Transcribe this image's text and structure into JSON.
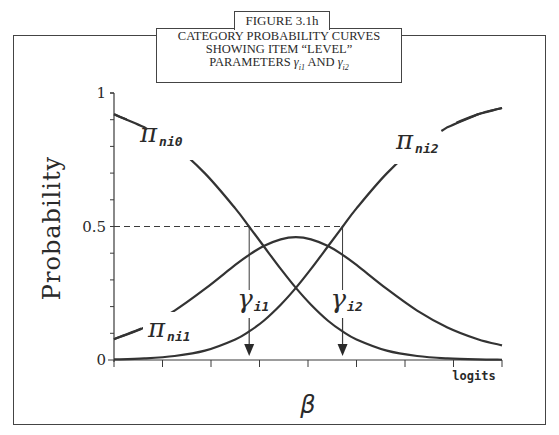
{
  "figure": {
    "tab_label": "FIGURE 3.1h",
    "title_lines": [
      "CATEGORY PROBABILITY CURVES",
      "SHOWING ITEM “LEVEL”",
      "PARAMETERS γi1 AND γi2"
    ]
  },
  "chart_data": {
    "type": "line",
    "title": "CATEGORY PROBABILITY CURVES SHOWING ITEM “LEVEL” PARAMETERS γi1 AND γi2",
    "xlabel": "β",
    "x_unit_label": "logits",
    "ylabel": "Probability",
    "yticks": [
      "0",
      "0.5",
      "1"
    ],
    "ylim": [
      0,
      1
    ],
    "xlim": [
      -3.0,
      3.4
    ],
    "x_tick_count": 9,
    "grid": false,
    "reference_line_y": 0.5,
    "thresholds": [
      {
        "name": "γi1",
        "symbol": "γ",
        "sub": "i1",
        "x": -0.77
      },
      {
        "name": "γi2",
        "symbol": "γ",
        "sub": "i2",
        "x": 0.77
      }
    ],
    "x": [
      -3.0,
      -2.5,
      -2.0,
      -1.5,
      -1.0,
      -0.77,
      -0.53,
      -0.25,
      0.0,
      0.25,
      0.53,
      0.77,
      1.0,
      1.5,
      2.0,
      2.5,
      3.0,
      3.4
    ],
    "series": [
      {
        "name": "πni0",
        "label_symbol": "π",
        "label_sub": "ni0",
        "values": [
          0.92,
          0.872,
          0.801,
          0.699,
          0.568,
          0.499,
          0.426,
          0.341,
          0.27,
          0.207,
          0.147,
          0.107,
          0.077,
          0.035,
          0.015,
          0.006,
          0.002,
          0.001
        ]
      },
      {
        "name": "πni1",
        "label_symbol": "π",
        "label_sub": "ni1",
        "values": [
          0.078,
          0.122,
          0.185,
          0.266,
          0.356,
          0.394,
          0.427,
          0.452,
          0.46,
          0.452,
          0.427,
          0.394,
          0.356,
          0.266,
          0.185,
          0.122,
          0.078,
          0.055
        ]
      },
      {
        "name": "πni2",
        "label_symbol": "π",
        "label_sub": "ni2",
        "values": [
          0.002,
          0.006,
          0.015,
          0.035,
          0.077,
          0.107,
          0.147,
          0.207,
          0.27,
          0.341,
          0.426,
          0.499,
          0.568,
          0.699,
          0.801,
          0.872,
          0.92,
          0.944
        ]
      }
    ]
  }
}
